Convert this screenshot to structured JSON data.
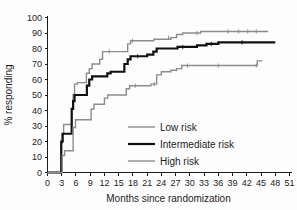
{
  "chart_data": {
    "type": "line",
    "title": "",
    "subtitle": "",
    "xlabel": "Months since randomization",
    "ylabel": "% responding",
    "xlim": [
      0,
      51
    ],
    "ylim": [
      0,
      100
    ],
    "xticks": [
      0,
      3,
      6,
      9,
      12,
      15,
      18,
      21,
      24,
      27,
      30,
      33,
      36,
      39,
      42,
      45,
      48,
      51
    ],
    "yticks": [
      0,
      10,
      20,
      30,
      40,
      50,
      60,
      70,
      80,
      90,
      100
    ],
    "grid": false,
    "legend_position": "center-right-inside",
    "step_interpolation": "post",
    "series": [
      {
        "name": "Low risk",
        "color": "#8c8c8c",
        "line_width": 1.4,
        "final_value": 91,
        "points": [
          [
            0,
            0
          ],
          [
            2.6,
            0
          ],
          [
            2.9,
            19
          ],
          [
            3.1,
            25
          ],
          [
            3.4,
            31
          ],
          [
            4.1,
            31
          ],
          [
            5.1,
            41
          ],
          [
            5.4,
            50
          ],
          [
            5.7,
            57
          ],
          [
            6.3,
            58
          ],
          [
            7.6,
            58
          ],
          [
            8.2,
            64
          ],
          [
            8.8,
            67
          ],
          [
            9.4,
            70
          ],
          [
            10.3,
            70
          ],
          [
            11.0,
            73
          ],
          [
            11.6,
            78
          ],
          [
            13.3,
            78
          ],
          [
            16.3,
            78
          ],
          [
            16.9,
            83
          ],
          [
            17.5,
            85
          ],
          [
            18.4,
            85
          ],
          [
            21.5,
            85
          ],
          [
            22.4,
            86
          ],
          [
            24.0,
            86
          ],
          [
            26.0,
            87
          ],
          [
            27.2,
            89
          ],
          [
            28.5,
            90
          ],
          [
            31.0,
            90
          ],
          [
            32.3,
            91
          ],
          [
            34.0,
            91
          ],
          [
            38.0,
            91
          ],
          [
            42.0,
            91
          ],
          [
            46.5,
            91
          ]
        ],
        "censor_marks": [
          [
            13.0,
            78
          ],
          [
            17.9,
            85
          ],
          [
            25.5,
            87
          ],
          [
            31.5,
            90
          ],
          [
            38.0,
            91
          ],
          [
            40.3,
            91
          ],
          [
            42.2,
            91
          ],
          [
            44.0,
            91
          ]
        ]
      },
      {
        "name": "Intermediate risk",
        "color": "#111111",
        "line_width": 2.2,
        "final_value": 84,
        "points": [
          [
            0,
            0
          ],
          [
            2.6,
            0
          ],
          [
            2.9,
            20
          ],
          [
            3.2,
            25
          ],
          [
            4.6,
            25
          ],
          [
            5.1,
            41
          ],
          [
            5.4,
            46
          ],
          [
            5.7,
            50
          ],
          [
            7.8,
            50
          ],
          [
            8.3,
            56
          ],
          [
            8.8,
            60
          ],
          [
            9.4,
            62
          ],
          [
            11.5,
            62
          ],
          [
            12.6,
            64
          ],
          [
            13.3,
            65
          ],
          [
            15.5,
            65
          ],
          [
            16.2,
            70
          ],
          [
            16.9,
            73
          ],
          [
            17.5,
            75
          ],
          [
            19.5,
            75
          ],
          [
            21.0,
            76
          ],
          [
            22.3,
            78
          ],
          [
            23.0,
            80
          ],
          [
            26.5,
            80
          ],
          [
            27.4,
            81
          ],
          [
            30.0,
            81
          ],
          [
            31.5,
            82
          ],
          [
            33.5,
            83
          ],
          [
            36.0,
            84
          ],
          [
            40.0,
            84
          ],
          [
            44.0,
            84
          ],
          [
            48.0,
            84
          ]
        ],
        "censor_marks": [
          [
            19.0,
            75
          ],
          [
            28.5,
            81
          ],
          [
            34.5,
            83
          ],
          [
            41.0,
            84
          ]
        ]
      },
      {
        "name": "High risk",
        "color": "#8c8c8c",
        "line_width": 1.4,
        "final_value": 72,
        "points": [
          [
            0,
            0
          ],
          [
            2.6,
            0
          ],
          [
            3.1,
            11
          ],
          [
            3.6,
            14
          ],
          [
            4.9,
            14
          ],
          [
            5.4,
            29
          ],
          [
            5.9,
            34
          ],
          [
            8.6,
            34
          ],
          [
            9.2,
            41
          ],
          [
            9.8,
            44
          ],
          [
            11.3,
            44
          ],
          [
            12.0,
            48
          ],
          [
            12.7,
            50
          ],
          [
            15.8,
            50
          ],
          [
            16.6,
            54
          ],
          [
            17.3,
            56
          ],
          [
            21.0,
            56
          ],
          [
            21.8,
            57
          ],
          [
            23.0,
            63
          ],
          [
            24.0,
            65
          ],
          [
            26.0,
            66
          ],
          [
            27.2,
            67
          ],
          [
            28.3,
            69
          ],
          [
            33.0,
            69
          ],
          [
            38.0,
            69
          ],
          [
            43.0,
            69
          ],
          [
            44.2,
            72
          ],
          [
            45.3,
            72
          ]
        ],
        "censor_marks": [
          [
            18.5,
            56
          ],
          [
            22.5,
            57
          ],
          [
            29.5,
            69
          ],
          [
            36.0,
            69
          ],
          [
            44.0,
            69
          ]
        ]
      }
    ]
  },
  "legend": {
    "items": [
      {
        "label": "Low risk",
        "color": "#8c8c8c",
        "line_width": 1.4
      },
      {
        "label": "Intermediate risk",
        "color": "#111111",
        "line_width": 2.2
      },
      {
        "label": "High risk",
        "color": "#8c8c8c",
        "line_width": 1.4
      }
    ]
  },
  "axes": {
    "x_title": "Months since randomization",
    "y_title": "% responding",
    "x_tick_labels": [
      "0",
      "3",
      "6",
      "9",
      "12",
      "15",
      "18",
      "21",
      "24",
      "27",
      "30",
      "33",
      "36",
      "39",
      "42",
      "45",
      "48",
      "51"
    ],
    "y_tick_labels": [
      "0",
      "10",
      "20",
      "30",
      "40",
      "50",
      "60",
      "70",
      "80",
      "90",
      "100"
    ]
  },
  "colors": {
    "axis": "#1c1c1c",
    "gray_series": "#8c8c8c",
    "black_series": "#111111",
    "background": "#fdfdfd"
  }
}
